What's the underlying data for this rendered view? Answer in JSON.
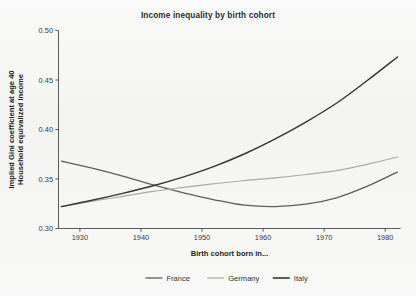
{
  "chart_data": {
    "type": "line",
    "title": "Income inequality by birth cohort",
    "xlabel": "Birth cohort born in...",
    "ylabel": "Implied Gini coefficient at age 40",
    "ylabel_line2": "Household equivalized income",
    "xlim": [
      1926.5,
      1982.5
    ],
    "ylim": [
      0.3,
      0.5
    ],
    "xticks": [
      1930,
      1940,
      1950,
      1960,
      1970,
      1980
    ],
    "xtick_labels": [
      "1930",
      "1940",
      "1950",
      "1960",
      "1970",
      "1980"
    ],
    "yticks": [
      0.3,
      0.35,
      0.4,
      0.45,
      0.5
    ],
    "ytick_labels": [
      "0.30",
      "0.35",
      "0.40",
      "0.45",
      "0.50"
    ],
    "grid": false,
    "legend_position": "bottom",
    "x": [
      1927,
      1932,
      1937,
      1942,
      1947,
      1952,
      1957,
      1962,
      1967,
      1972,
      1977,
      1982
    ],
    "series": [
      {
        "name": "France",
        "color": "#5c5c5c",
        "width": 1.25,
        "values": [
          0.368,
          0.361,
          0.353,
          0.344,
          0.336,
          0.329,
          0.3235,
          0.3222,
          0.3245,
          0.331,
          0.3425,
          0.357
        ]
      },
      {
        "name": "Germany",
        "color": "#a9a9a9",
        "width": 1.15,
        "values": [
          0.322,
          0.3275,
          0.3325,
          0.3375,
          0.3415,
          0.3452,
          0.3485,
          0.3512,
          0.3545,
          0.3585,
          0.3648,
          0.3722
        ]
      },
      {
        "name": "Italy",
        "color": "#353535",
        "width": 1.45,
        "values": [
          0.3222,
          0.3285,
          0.3355,
          0.3432,
          0.3522,
          0.3628,
          0.3755,
          0.3905,
          0.4075,
          0.4265,
          0.4492,
          0.4732
        ]
      }
    ]
  },
  "legend": {
    "items": [
      {
        "label": "France",
        "color": "#5c5c5c"
      },
      {
        "label": "Germany",
        "color": "#a9a9a9"
      },
      {
        "label": "Italy",
        "color": "#353535"
      }
    ]
  }
}
